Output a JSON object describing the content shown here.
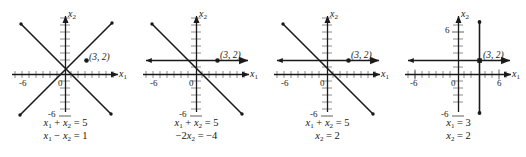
{
  "figure": {
    "type": "multi-panel-plot",
    "panel_count": 4,
    "axis_color": "#1a1a1a",
    "line_color": "#1a1a1a",
    "tick_color": "#6e6e6e",
    "background": "#ffffff"
  },
  "chart_data": [
    {
      "type": "line",
      "title": "",
      "xlabel": "x₁",
      "ylabel": "x₂",
      "xlim": [
        -9,
        9
      ],
      "ylim": [
        -9,
        9
      ],
      "grid": false,
      "xticks": [
        -6,
        0
      ],
      "yticks": [
        -6
      ],
      "xtick_labels": [
        "-6",
        "0"
      ],
      "ytick_labels": [
        "-6"
      ],
      "series": [
        {
          "name": "x₁ + x₂ = 5",
          "kind": "line",
          "slope": -1,
          "intercept": 5
        },
        {
          "name": "x₁ - x₂ = 1",
          "kind": "line",
          "slope": 1,
          "intercept": -1
        }
      ],
      "annotations": [
        {
          "label": "(3, 2)",
          "x": 3,
          "y": 2,
          "marker": "dot"
        }
      ]
    },
    {
      "type": "line",
      "title": "",
      "xlabel": "x₁",
      "ylabel": "x₂",
      "xlim": [
        -9,
        9
      ],
      "ylim": [
        -9,
        9
      ],
      "grid": false,
      "xticks": [
        -6,
        0
      ],
      "yticks": [
        -6
      ],
      "xtick_labels": [
        "-6",
        "0"
      ],
      "ytick_labels": [
        "-6"
      ],
      "series": [
        {
          "name": "x₁ + x₂ = 5",
          "kind": "line",
          "slope": -1,
          "intercept": 5
        },
        {
          "name": "-2x₂ = -4",
          "kind": "horizontal",
          "y": 2
        }
      ],
      "annotations": [
        {
          "label": "(3, 2)",
          "x": 3,
          "y": 2,
          "marker": "dot"
        }
      ]
    },
    {
      "type": "line",
      "title": "",
      "xlabel": "x₁",
      "ylabel": "x₂",
      "xlim": [
        -9,
        9
      ],
      "ylim": [
        -9,
        9
      ],
      "grid": false,
      "xticks": [
        -6,
        0
      ],
      "yticks": [
        -6
      ],
      "xtick_labels": [
        "-6",
        "0"
      ],
      "ytick_labels": [
        "-6"
      ],
      "series": [
        {
          "name": "x₁ + x₂ = 5",
          "kind": "line",
          "slope": -1,
          "intercept": 5
        },
        {
          "name": "x₂ = 2",
          "kind": "horizontal",
          "y": 2
        }
      ],
      "annotations": [
        {
          "label": "(3, 2)",
          "x": 3,
          "y": 2,
          "marker": "dot"
        }
      ]
    },
    {
      "type": "line",
      "title": "",
      "xlabel": "x₁",
      "ylabel": "x₂",
      "xlim": [
        -9,
        9
      ],
      "ylim": [
        -9,
        9
      ],
      "grid": false,
      "xticks": [
        -6,
        0,
        6
      ],
      "yticks": [
        6,
        -6
      ],
      "xtick_labels": [
        "-6",
        "0",
        "6"
      ],
      "ytick_labels": [
        "6",
        "-6"
      ],
      "series": [
        {
          "name": "x₁ = 3",
          "kind": "vertical",
          "x": 3
        },
        {
          "name": "x₂ = 2",
          "kind": "horizontal",
          "y": 2
        }
      ],
      "annotations": [
        {
          "label": "(3, 2)",
          "x": 3,
          "y": 2,
          "marker": "dot"
        }
      ]
    }
  ],
  "panels": [
    {
      "id": "panel-1",
      "x_axis_label": "x",
      "x_axis_sub": "1",
      "y_axis_label": "x",
      "y_axis_sub": "2",
      "point_label": "(3, 2)",
      "tick_label_neg6_x": "-6",
      "tick_label_zero": "0",
      "tick_label_neg6_y": "-6",
      "tick_label_pos6_x": "",
      "tick_label_pos6_y": "",
      "equation_1": {
        "terms": [
          {
            "text": "x",
            "kind": "var"
          },
          {
            "text": "1",
            "kind": "sub"
          },
          {
            "text": " + ",
            "kind": "op"
          },
          {
            "text": "x",
            "kind": "var"
          },
          {
            "text": "2",
            "kind": "sub"
          },
          {
            "text": " = ",
            "kind": "op"
          },
          {
            "text": "5",
            "kind": "num"
          }
        ],
        "plain": "x1 + x2 = 5"
      },
      "equation_2": {
        "terms": [
          {
            "text": "x",
            "kind": "var"
          },
          {
            "text": "1",
            "kind": "sub"
          },
          {
            "text": " − ",
            "kind": "op"
          },
          {
            "text": "x",
            "kind": "var"
          },
          {
            "text": "2",
            "kind": "sub"
          },
          {
            "text": " = ",
            "kind": "op"
          },
          {
            "text": "1",
            "kind": "num"
          }
        ],
        "plain": "x1 - x2 = 1"
      }
    },
    {
      "id": "panel-2",
      "x_axis_label": "x",
      "x_axis_sub": "1",
      "y_axis_label": "x",
      "y_axis_sub": "2",
      "point_label": "(3, 2)",
      "tick_label_neg6_x": "-6",
      "tick_label_zero": "0",
      "tick_label_neg6_y": "-6",
      "tick_label_pos6_x": "",
      "tick_label_pos6_y": "",
      "equation_1": {
        "terms": [
          {
            "text": "x",
            "kind": "var"
          },
          {
            "text": "1",
            "kind": "sub"
          },
          {
            "text": " + ",
            "kind": "op"
          },
          {
            "text": "x",
            "kind": "var"
          },
          {
            "text": "2",
            "kind": "sub"
          },
          {
            "text": " = ",
            "kind": "op"
          },
          {
            "text": "5",
            "kind": "num"
          }
        ],
        "plain": "x1 + x2 = 5"
      },
      "equation_2": {
        "terms": [
          {
            "text": "−2",
            "kind": "num"
          },
          {
            "text": "x",
            "kind": "var"
          },
          {
            "text": "2",
            "kind": "sub"
          },
          {
            "text": " = ",
            "kind": "op"
          },
          {
            "text": "−4",
            "kind": "num"
          }
        ],
        "plain": "-2x2 = -4"
      }
    },
    {
      "id": "panel-3",
      "x_axis_label": "x",
      "x_axis_sub": "1",
      "y_axis_label": "x",
      "y_axis_sub": "2",
      "point_label": "(3, 2)",
      "tick_label_neg6_x": "-6",
      "tick_label_zero": "0",
      "tick_label_neg6_y": "-6",
      "tick_label_pos6_x": "",
      "tick_label_pos6_y": "",
      "equation_1": {
        "terms": [
          {
            "text": "x",
            "kind": "var"
          },
          {
            "text": "1",
            "kind": "sub"
          },
          {
            "text": " + ",
            "kind": "op"
          },
          {
            "text": "x",
            "kind": "var"
          },
          {
            "text": "2",
            "kind": "sub"
          },
          {
            "text": " = ",
            "kind": "op"
          },
          {
            "text": "5",
            "kind": "num"
          }
        ],
        "plain": "x1 + x2 = 5"
      },
      "equation_2": {
        "terms": [
          {
            "text": "x",
            "kind": "var"
          },
          {
            "text": "2",
            "kind": "sub"
          },
          {
            "text": " = ",
            "kind": "op"
          },
          {
            "text": "2",
            "kind": "num"
          }
        ],
        "plain": "x2 = 2"
      }
    },
    {
      "id": "panel-4",
      "x_axis_label": "x",
      "x_axis_sub": "1",
      "y_axis_label": "x",
      "y_axis_sub": "2",
      "point_label": "(3, 2)",
      "tick_label_neg6_x": "-6",
      "tick_label_zero": "0",
      "tick_label_neg6_y": "-6",
      "tick_label_pos6_x": "6",
      "tick_label_pos6_y": "6",
      "equation_1": {
        "terms": [
          {
            "text": "x",
            "kind": "var"
          },
          {
            "text": "1",
            "kind": "sub"
          },
          {
            "text": " = ",
            "kind": "op"
          },
          {
            "text": "3",
            "kind": "num"
          }
        ],
        "plain": "x1 = 3"
      },
      "equation_2": {
        "terms": [
          {
            "text": "x",
            "kind": "var"
          },
          {
            "text": "2",
            "kind": "sub"
          },
          {
            "text": " = ",
            "kind": "op"
          },
          {
            "text": "2",
            "kind": "num"
          }
        ],
        "plain": "x2 = 2"
      }
    }
  ]
}
